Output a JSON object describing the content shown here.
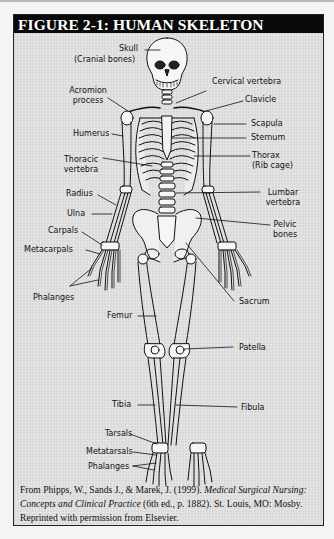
{
  "figure": {
    "title": "FIGURE 2-1: HUMAN SKELETON",
    "background_color": "#e4e4e4",
    "header_color": "#0a0a0a",
    "header_text_color": "#ffffff"
  },
  "labels": {
    "skull": "Skull",
    "cranial_bones": "(Cranial bones)",
    "acromion_1": "Acromion",
    "acromion_2": "process",
    "humerus": "Humerus",
    "thoracic_1": "Thoracic",
    "thoracic_2": "vertebra",
    "radius": "Radius",
    "ulna": "Ulna",
    "carpals": "Carpals",
    "metacarpals": "Metacarpals",
    "phalanges_hand": "Phalanges",
    "femur": "Femur",
    "tibia": "Tibia",
    "tarsals": "Tarsals",
    "metatarsals": "Metatarsals",
    "phalanges_foot": "Phalanges",
    "cervical": "Cervical vertebra",
    "clavicle": "Clavicle",
    "scapula": "Scapula",
    "sternum": "Sternum",
    "thorax_1": "Thorax",
    "thorax_2": "(Rib cage)",
    "lumbar_1": "Lumbar",
    "lumbar_2": "vertebra",
    "pelvic_1": "Pelvic",
    "pelvic_2": "bones",
    "sacrum": "Sacrum",
    "patella": "Patella",
    "fibula": "Fibula"
  },
  "caption": {
    "part1": "From Phipps, W., Sands J., & Marek, J. (1999). ",
    "italic": "Medical Surgical Nursing: Concepts and Clinical Practice",
    "part2": " (6th ed., p. 1882). St. Louis, MO: Mosby. Reprinted with permission from Elsevier."
  }
}
